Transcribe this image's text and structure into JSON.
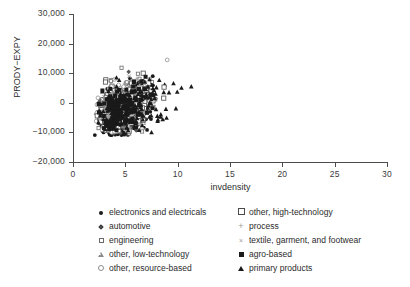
{
  "chart_data": {
    "type": "scatter",
    "title": "",
    "xlabel": "invdensity",
    "ylabel": "PRODY−EXPY",
    "xlim": [
      0,
      30
    ],
    "ylim": [
      -20000,
      30000
    ],
    "grid": false,
    "x_ticks": [
      "0",
      "5",
      "10",
      "15",
      "20",
      "25",
      "30"
    ],
    "x_tick_values": [
      0,
      5,
      10,
      15,
      20,
      25,
      30
    ],
    "y_ticks": [
      "30,000",
      "20,000",
      "10,000",
      "0",
      "−10,000",
      "−20,000"
    ],
    "y_tick_values": [
      30000,
      20000,
      10000,
      0,
      -10000,
      -20000
    ],
    "legend_position": "below-plot",
    "series": [
      {
        "name": "electronics and electricals",
        "marker": "filled-circle",
        "color": "#1a1a1a",
        "n_points": 520,
        "x_range": [
          2.0,
          8.2
        ],
        "y_range": [
          -11000,
          12000
        ],
        "x_center": 4.3,
        "y_center": -3200
      },
      {
        "name": "automotive",
        "marker": "filled-diamond",
        "color": "#555555",
        "n_points": 150,
        "x_range": [
          2.2,
          7.8
        ],
        "y_range": [
          -10500,
          11500
        ],
        "x_center": 4.4,
        "y_center": -2500
      },
      {
        "name": "engineering",
        "marker": "open-square-small",
        "color": "#6a6a6a",
        "n_points": 230,
        "x_range": [
          2.1,
          8.0
        ],
        "y_range": [
          -10500,
          12000
        ],
        "x_center": 4.4,
        "y_center": -1800
      },
      {
        "name": "other, low-technology",
        "marker": "open-triangle",
        "color": "#8a8a8a",
        "n_points": 130,
        "x_range": [
          2.2,
          7.9
        ],
        "y_range": [
          -10000,
          10000
        ],
        "x_center": 4.3,
        "y_center": -2000
      },
      {
        "name": "other, resource-based",
        "marker": "open-circle",
        "color": "#8f8f8f",
        "n_points": 120,
        "x_range": [
          2.2,
          9.0
        ],
        "y_range": [
          -10000,
          14500
        ],
        "x_center": 4.4,
        "y_center": -1500
      },
      {
        "name": "other, high-technology",
        "marker": "open-square",
        "color": "#4a4a4a",
        "n_points": 140,
        "x_range": [
          2.2,
          8.7
        ],
        "y_range": [
          -10000,
          12500
        ],
        "x_center": 4.5,
        "y_center": -1200
      },
      {
        "name": "process",
        "marker": "plus",
        "color": "#9a9a9a",
        "n_points": 70,
        "x_range": [
          2.3,
          7.6
        ],
        "y_range": [
          -9500,
          9500
        ],
        "x_center": 4.4,
        "y_center": -1500
      },
      {
        "name": "textile, garment, and footwear",
        "marker": "cross",
        "color": "#9a9a9a",
        "n_points": 80,
        "x_range": [
          2.2,
          7.5
        ],
        "y_range": [
          -9500,
          9500
        ],
        "x_center": 4.3,
        "y_center": -2000
      },
      {
        "name": "agro-based",
        "marker": "filled-square",
        "color": "#1a1a1a",
        "n_points": 160,
        "x_range": [
          2.2,
          8.0
        ],
        "y_range": [
          -10500,
          12000
        ],
        "x_center": 4.4,
        "y_center": -2800
      },
      {
        "name": "primary products",
        "marker": "filled-triangle",
        "color": "#1a1a1a",
        "n_points": 190,
        "x_range": [
          2.3,
          11.3
        ],
        "y_range": [
          -10500,
          13000
        ],
        "x_center": 4.8,
        "y_center": -2600
      }
    ],
    "notable_outliers": [
      {
        "series": "other, resource-based",
        "x": 9.0,
        "y": 14500
      },
      {
        "series": "primary products",
        "x": 11.3,
        "y": 5500
      },
      {
        "series": "other, high-technology",
        "x": 8.7,
        "y": 5300
      },
      {
        "series": "primary products",
        "x": 7.5,
        "y": -10000
      },
      {
        "series": "agro-based",
        "x": 7.6,
        "y": -1800
      }
    ]
  },
  "axes": {
    "x_title": "invdensity",
    "y_title": "PRODY−EXPY"
  },
  "legend": {
    "left_column": [
      {
        "label": "electronics and electricals",
        "marker": "filled-circle"
      },
      {
        "label": "automotive",
        "marker": "filled-diamond"
      },
      {
        "label": "engineering",
        "marker": "open-square-small"
      },
      {
        "label": "other, low-technology",
        "marker": "open-triangle"
      },
      {
        "label": "other, resource-based",
        "marker": "open-circle"
      }
    ],
    "right_column": [
      {
        "label": "other, high-technology",
        "marker": "open-square"
      },
      {
        "label": "process",
        "marker": "plus"
      },
      {
        "label": "textile, garment, and footwear",
        "marker": "cross"
      },
      {
        "label": "agro-based",
        "marker": "filled-square"
      },
      {
        "label": "primary products",
        "marker": "filled-triangle"
      }
    ]
  }
}
